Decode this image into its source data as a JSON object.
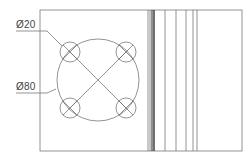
{
  "drawing": {
    "type": "technical-drawing",
    "view_left": "top view of flange plate with bolt circle",
    "view_right": "side section with vertical edge lines",
    "annotations": [
      {
        "id": "small_hole_dim",
        "text": "Ø20"
      },
      {
        "id": "bolt_circle_dim",
        "text": "Ø80"
      }
    ],
    "colors": {
      "line": "#555555",
      "text": "#444444",
      "background": "#ffffff"
    }
  }
}
